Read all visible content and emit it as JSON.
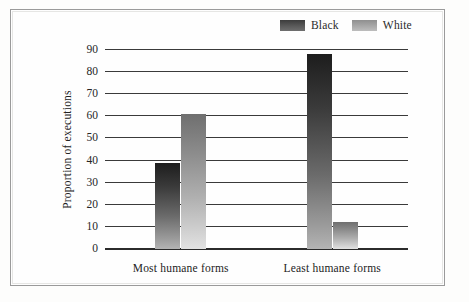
{
  "chart_data": {
    "type": "bar",
    "title": "",
    "subtitle": "",
    "xlabel": "",
    "ylabel": "Proportion of executions",
    "ylim": [
      0,
      90
    ],
    "yticks": [
      90,
      80,
      70,
      60,
      50,
      40,
      30,
      20,
      10,
      0
    ],
    "grid": true,
    "legend_position": "top-right",
    "categories": [
      "Most humane forms",
      "Least humane forms"
    ],
    "series": [
      {
        "name": "Black",
        "color": "#3c3c3c",
        "values": [
          39,
          88
        ]
      },
      {
        "name": "White",
        "color": "#a8a8a8",
        "values": [
          61,
          12
        ]
      }
    ]
  },
  "legend": {
    "entries": [
      {
        "label": "Black",
        "swatch": "black-gradient-swatch"
      },
      {
        "label": "White",
        "swatch": "white-gradient-swatch"
      }
    ]
  },
  "axes": {
    "y_title": "Proportion of executions",
    "y_labels": [
      "90",
      "80",
      "70",
      "60",
      "50",
      "40",
      "30",
      "20",
      "10",
      "0"
    ],
    "x_labels": [
      "Most humane forms",
      "Least humane forms"
    ]
  },
  "colors": {
    "background": "#fdfdfc",
    "frame": "#9a9a9a",
    "axis": "#2b2b2b",
    "grid": "#3a3a3a",
    "black_series": "#3c3c3c",
    "white_series": "#a8a8a8"
  }
}
